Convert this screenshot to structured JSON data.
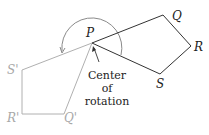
{
  "diagram": {
    "colors": {
      "original": "#333333",
      "image": "#aaaaaa",
      "arc": "#888888"
    },
    "original_polygon": {
      "labels": {
        "P": "P",
        "Q": "Q",
        "R": "R",
        "S": "S"
      }
    },
    "image_polygon": {
      "labels": {
        "S_prime": "S'",
        "R_prime": "R'",
        "Q_prime": "Q'"
      }
    },
    "annotation": {
      "line1": "Center",
      "line2": "of",
      "line3": "rotation"
    }
  }
}
